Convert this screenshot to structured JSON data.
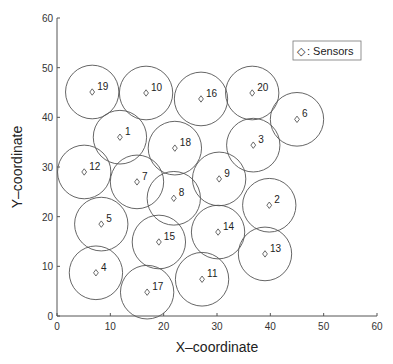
{
  "chart_data": {
    "type": "scatter",
    "title": "",
    "xlabel": "X–coordinate",
    "ylabel": "Y–coordinate",
    "xlim": [
      0,
      60
    ],
    "ylim": [
      0,
      60
    ],
    "xticks": [
      0,
      10,
      20,
      30,
      40,
      50,
      60
    ],
    "yticks": [
      0,
      10,
      20,
      30,
      40,
      50,
      60
    ],
    "grid": false,
    "legend": {
      "position": "upper-right",
      "entries": [
        "◇ : Sensors"
      ]
    },
    "marker": "diamond",
    "coverage_radius": 5,
    "series": [
      {
        "name": "Sensors",
        "points": [
          {
            "id": 1,
            "x": 11.8,
            "y": 36.0
          },
          {
            "id": 2,
            "x": 39.8,
            "y": 22.3
          },
          {
            "id": 3,
            "x": 36.8,
            "y": 34.4
          },
          {
            "id": 4,
            "x": 7.3,
            "y": 8.7
          },
          {
            "id": 5,
            "x": 8.3,
            "y": 18.5
          },
          {
            "id": 6,
            "x": 45.0,
            "y": 39.6
          },
          {
            "id": 7,
            "x": 15.0,
            "y": 27.0
          },
          {
            "id": 8,
            "x": 21.9,
            "y": 23.7
          },
          {
            "id": 9,
            "x": 30.4,
            "y": 27.6
          },
          {
            "id": 10,
            "x": 16.7,
            "y": 44.9
          },
          {
            "id": 11,
            "x": 27.2,
            "y": 7.4
          },
          {
            "id": 12,
            "x": 5.1,
            "y": 29.0
          },
          {
            "id": 13,
            "x": 39.0,
            "y": 12.5
          },
          {
            "id": 14,
            "x": 30.2,
            "y": 16.9
          },
          {
            "id": 15,
            "x": 19.1,
            "y": 14.9
          },
          {
            "id": 16,
            "x": 27.0,
            "y": 43.7
          },
          {
            "id": 17,
            "x": 16.9,
            "y": 4.8
          },
          {
            "id": 18,
            "x": 22.1,
            "y": 33.8
          },
          {
            "id": 19,
            "x": 6.6,
            "y": 45.1
          },
          {
            "id": 20,
            "x": 36.6,
            "y": 44.9
          }
        ]
      }
    ]
  },
  "legend": {
    "marker": "◇",
    "label": ": Sensors"
  },
  "axes": {
    "xlabel": "X–coordinate",
    "ylabel": "Y–coordinate"
  },
  "colors": {
    "axis": "#555555",
    "circle": "#555555",
    "marker": "#444444",
    "text": "#222222"
  }
}
